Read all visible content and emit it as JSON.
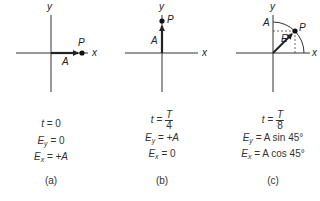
{
  "panels": [
    {
      "id": "a",
      "axis_labels": {
        "x": "x",
        "y": "y"
      },
      "vector_label": "A",
      "point_label": "P",
      "time_var": "t",
      "time_value": "0",
      "ey_label": "E",
      "ey_sub": "y",
      "ey_value": "0",
      "ex_label": "E",
      "ex_sub": "x",
      "ex_value": "+A",
      "caption": "(a)"
    },
    {
      "id": "b",
      "axis_labels": {
        "x": "x",
        "y": "y"
      },
      "vector_label": "A",
      "point_label": "P",
      "time_var": "t",
      "time_num": "T",
      "time_den": "4",
      "ey_label": "E",
      "ey_sub": "y",
      "ey_value": "+A",
      "ex_label": "E",
      "ex_sub": "x",
      "ex_value": "0",
      "caption": "(b)"
    },
    {
      "id": "c",
      "axis_labels": {
        "x": "x",
        "y": "y"
      },
      "vector_label": "E",
      "amplitude_label": "A",
      "point_label": "P",
      "time_var": "t",
      "time_num": "T",
      "time_den": "8",
      "ey_label": "E",
      "ey_sub": "y",
      "ey_value": "A sin 45°",
      "ex_label": "E",
      "ex_sub": "x",
      "ex_value": "A cos 45°",
      "caption": "(c)"
    }
  ],
  "colors": {
    "ink": "#222222",
    "background": "#ffffff"
  }
}
